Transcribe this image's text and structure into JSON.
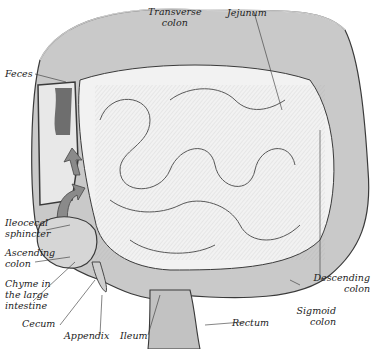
{
  "diagram": {
    "palette": {
      "background": "#ffffff",
      "outline": "#3a3a3a",
      "colon_fill": "#c9c9c9",
      "small_intestine_fill": "#f2f2f2",
      "feces_fill": "#6e6e6e",
      "arrow_fill": "#8a8a8a",
      "label": "#222222"
    },
    "labels": {
      "transverse_colon": [
        "Transverse",
        "colon"
      ],
      "jejunum": "Jejunum",
      "feces": "Feces",
      "ileocecal_sphincter": [
        "Ileocecal",
        "sphincter"
      ],
      "ascending_colon": [
        "Ascending",
        "colon"
      ],
      "chyme": [
        "Chyme in",
        "the large",
        "intestine"
      ],
      "cecum": "Cecum",
      "appendix": "Appendix",
      "ileum": "Ileum",
      "rectum": "Rectum",
      "descending_colon": [
        "Descending",
        "colon"
      ],
      "sigmoid_colon": [
        "Sigmoid",
        "colon"
      ]
    }
  }
}
